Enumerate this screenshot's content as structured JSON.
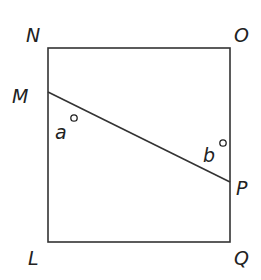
{
  "diagram": {
    "type": "geometry",
    "shape": "square",
    "vertices": {
      "N": "N",
      "O": "O",
      "L": "L",
      "Q": "Q"
    },
    "points_on_sides": {
      "M": "M",
      "P": "P"
    },
    "segment": "MP",
    "angles": {
      "a": "a",
      "b": "b"
    },
    "colors": {
      "line": "#333333",
      "text": "#222222",
      "background": "#ffffff"
    }
  }
}
